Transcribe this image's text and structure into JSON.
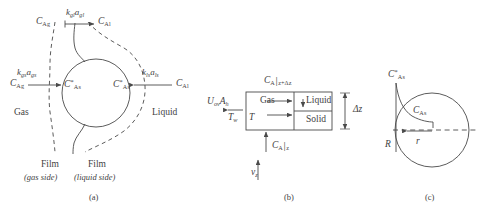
{
  "figure": {
    "background_color": "#ffffff",
    "line_color": "#4a4a4a",
    "text_color": "#3f3f3f",
    "panel_count": 3
  },
  "panel_a": {
    "caption": "(a)",
    "region_left_label": "Gas",
    "region_right_label": "Liquid",
    "film_left_title": "Film",
    "film_left_sub": "(gas side)",
    "film_right_title": "Film",
    "film_right_sub": "(liquid side)",
    "top_left_conc": {
      "symbol": "C",
      "sub": "Ag"
    },
    "top_right_conc": {
      "symbol": "C",
      "sub": "Al"
    },
    "top_coefficient": {
      "k": "k",
      "k_sub": "gl",
      "a": "a",
      "a_sub": "gl"
    },
    "left_coefficient": {
      "k": "k",
      "k_sub": "gs",
      "a": "a",
      "a_sub": "gs"
    },
    "left_conc": {
      "symbol": "C",
      "sub": "Ag"
    },
    "left_surface_conc": {
      "symbol": "C",
      "sup": "*",
      "sub": "As"
    },
    "right_coefficient": {
      "k": "k",
      "k_sub": "ls",
      "a": "a",
      "a_sub": "ls"
    },
    "right_conc": {
      "symbol": "C",
      "sub": "Al"
    },
    "right_surface_conc": {
      "symbol": "C",
      "sup": "*",
      "sub": "As"
    }
  },
  "panel_b": {
    "caption": "(b)",
    "cell_gas": "Gas",
    "cell_liquid": "Liquid",
    "cell_solid": "Solid",
    "heat_term": {
      "u": "U",
      "u_sub": "ov",
      "a": "A",
      "a_sub": "h"
    },
    "wall_temp": {
      "symbol": "T",
      "sub": "w"
    },
    "bulk_temp": {
      "symbol": "T"
    },
    "flux_top": {
      "symbol": "C",
      "sub": "A",
      "bar": "|",
      "at": "z+Δz"
    },
    "flux_bottom": {
      "symbol": "C",
      "sub": "A",
      "bar": "|",
      "at": "z"
    },
    "velocity": {
      "symbol": "v",
      "sub": "z"
    },
    "height_label": "Δz"
  },
  "panel_c": {
    "caption": "(c)",
    "surface_conc": {
      "symbol": "C",
      "sup": "*",
      "sub": "As"
    },
    "interior_conc": {
      "symbol": "C",
      "sub": "As"
    },
    "radius_outer": {
      "symbol": "R"
    },
    "radius_inner": {
      "symbol": "r"
    }
  }
}
